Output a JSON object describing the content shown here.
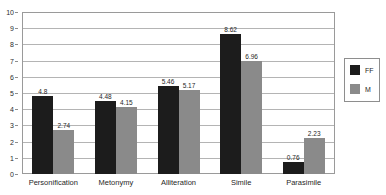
{
  "chart_data": {
    "type": "bar",
    "title": "",
    "xlabel": "",
    "ylabel": "",
    "ylim": [
      0,
      10
    ],
    "y_ticks": [
      "0",
      "1",
      "2",
      "3",
      "4",
      "5",
      "6",
      "7",
      "8",
      "9",
      "10"
    ],
    "grid": true,
    "legend_position": "right",
    "categories": [
      "Personification",
      "Metonymy",
      "Alliteration",
      "Simile",
      "Parasimile"
    ],
    "series": [
      {
        "name": "FF",
        "color": "#1c1c1c",
        "values": [
          4.8,
          4.48,
          5.46,
          8.62,
          0.76
        ],
        "labels": [
          "4.8",
          "4.48",
          "5.46",
          "8.62",
          "0.76"
        ]
      },
      {
        "name": "M",
        "color": "#8a8a8a",
        "values": [
          2.74,
          4.15,
          5.17,
          6.96,
          2.23
        ],
        "labels": [
          "2.74",
          "4.15",
          "5.17",
          "6.96",
          "2.23"
        ]
      }
    ]
  },
  "legend": {
    "entries": [
      {
        "label": "FF",
        "color": "#1c1c1c"
      },
      {
        "label": "M",
        "color": "#8a8a8a"
      }
    ]
  },
  "title_remnant": {
    "text": ""
  }
}
